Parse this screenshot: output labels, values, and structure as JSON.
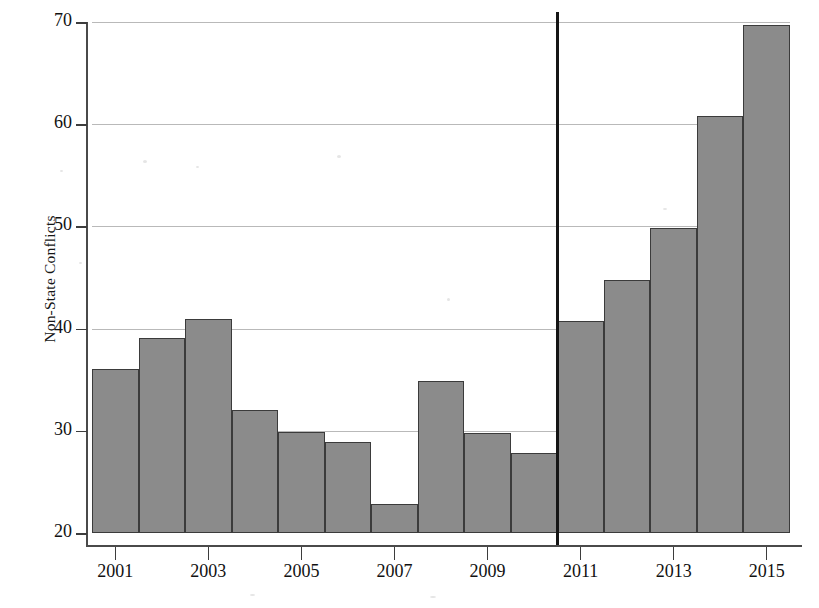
{
  "chart_data": {
    "type": "bar",
    "title": "",
    "xlabel": "",
    "ylabel": "Non-State Conflicts",
    "categories": [
      "2001",
      "2002",
      "2003",
      "2004",
      "2005",
      "2006",
      "2007",
      "2008",
      "2009",
      "2010",
      "2011",
      "2012",
      "2013",
      "2014",
      "2015"
    ],
    "values": [
      36.0,
      39.1,
      40.9,
      32.0,
      29.9,
      28.9,
      22.8,
      34.9,
      29.8,
      27.8,
      40.7,
      44.8,
      49.8,
      60.8,
      69.7
    ],
    "ylim": [
      20,
      70
    ],
    "yticks": [
      20,
      30,
      40,
      50,
      60,
      70
    ],
    "ytick_labels": [
      "20",
      "30",
      "40",
      "50",
      "60",
      "70"
    ],
    "xtick_labels": [
      "2001",
      "2003",
      "2005",
      "2007",
      "2009",
      "2011",
      "2013",
      "2015"
    ],
    "xtick_categories": [
      "2001",
      "2003",
      "2005",
      "2007",
      "2009",
      "2011",
      "2013",
      "2015"
    ],
    "grid": true,
    "legend": "none",
    "bar_color": "#8b8b8b",
    "bar_edge_color": "#3b3b3b",
    "grid_color": "#b9b9b9",
    "axis_color": "#4a4a4a",
    "annotations": [
      {
        "name": "vertical-reference-line",
        "kind": "vline",
        "at_category": "2011",
        "position": "left-edge-of-2011-bar",
        "color": "#151515",
        "top_value": 71.0,
        "bottom_value": 20.0
      }
    ]
  }
}
